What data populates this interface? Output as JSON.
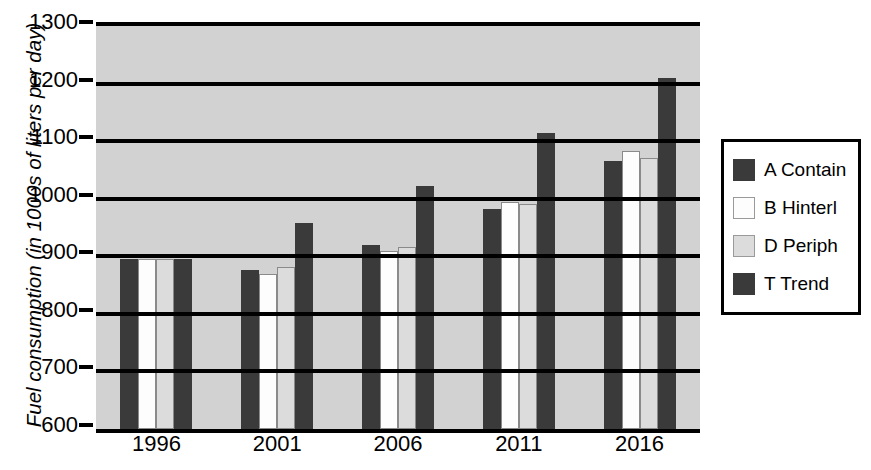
{
  "chart_data": {
    "type": "bar",
    "title": "",
    "subtitle": "",
    "xlabel": "",
    "ylabel": "Fuel consumption (in 1000s of liters per day)",
    "categories": [
      "1996",
      "2001",
      "2006",
      "2011",
      "2016"
    ],
    "series": [
      {
        "name": "A Contain",
        "color": "#3a3a3a",
        "values": [
          895,
          877,
          920,
          983,
          1065
        ]
      },
      {
        "name": "B Hinterl",
        "color": "#fdfdfd",
        "values": [
          895,
          870,
          910,
          995,
          1083
        ]
      },
      {
        "name": "D Periph",
        "color": "#dcdcdc",
        "values": [
          895,
          882,
          917,
          991,
          1070
        ]
      },
      {
        "name": "T Trend",
        "color": "#3a3a3a",
        "values": [
          895,
          957,
          1022,
          1115,
          1210
        ]
      }
    ],
    "ylim": [
      600,
      1300
    ],
    "ytick_values": [
      600,
      700,
      800,
      900,
      1000,
      1100,
      1200,
      1300
    ],
    "ytick_labels": [
      "600",
      "700",
      "800",
      "900",
      "1000",
      "1100",
      "1200",
      "1300"
    ],
    "grid": true,
    "grid_axis": "y",
    "legend_position": "right",
    "plot_background": "#d2d2d2",
    "page_background": "#ffffff",
    "axis_color": "#000000"
  },
  "legend": {
    "items": [
      {
        "label": "A Contain",
        "swatch": "dark-swatch"
      },
      {
        "label": "B Hinterl",
        "swatch": "white-swatch"
      },
      {
        "label": "D Periph",
        "swatch": "light-gray-swatch"
      },
      {
        "label": "T Trend",
        "swatch": "dark-swatch"
      }
    ]
  }
}
